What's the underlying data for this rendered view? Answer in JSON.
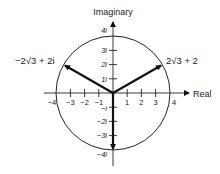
{
  "diagram": {
    "axes": {
      "x_label": "Real",
      "y_label": "Imaginary",
      "x_ticks": [
        "-4",
        "-3",
        "-2",
        "-1",
        "1",
        "2",
        "3",
        "4"
      ],
      "y_ticks_pos": [
        "1i",
        "2i",
        "3i",
        "4i"
      ],
      "y_ticks_neg": [
        "-i",
        "-2i",
        "-3i",
        "-4i"
      ]
    },
    "circle": {
      "radius": 4,
      "center": "origin"
    },
    "vectors": [
      {
        "name": "left",
        "label": "−2√3 + 2i",
        "x": -3.464,
        "y": 2
      },
      {
        "name": "right",
        "label": "2√3 + 2",
        "x": 3.464,
        "y": 2
      },
      {
        "name": "down",
        "label": "",
        "x": 0,
        "y": -4
      }
    ],
    "labels": {
      "left_vector": "−2√3 + 2i",
      "right_vector": "2√3 + 2",
      "real_axis": "Real",
      "imag_axis": "Imaginary",
      "x_neg4": "−4",
      "x_neg3": "−3",
      "x_neg2": "−2",
      "x_neg1": "−1",
      "x_1": "1",
      "x_2": "2",
      "x_3": "3",
      "x_4": "4",
      "y_4": "4i",
      "y_3": "3i",
      "y_2": "2i",
      "y_1": "1i",
      "y_neg1": "−i",
      "y_neg2": "−2i",
      "y_neg3": "−3i",
      "y_neg4": "−4i"
    }
  }
}
